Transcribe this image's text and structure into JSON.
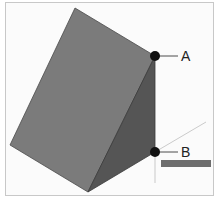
{
  "diagram": {
    "points": [
      {
        "label": "A",
        "x": 155,
        "y": 56
      },
      {
        "label": "B",
        "x": 155,
        "y": 152
      }
    ],
    "tooltip": "",
    "colors": {
      "front_face": "#7a7a7a",
      "side_face": "#555555",
      "point": "#111111",
      "frame": "#c8c8c8"
    }
  }
}
